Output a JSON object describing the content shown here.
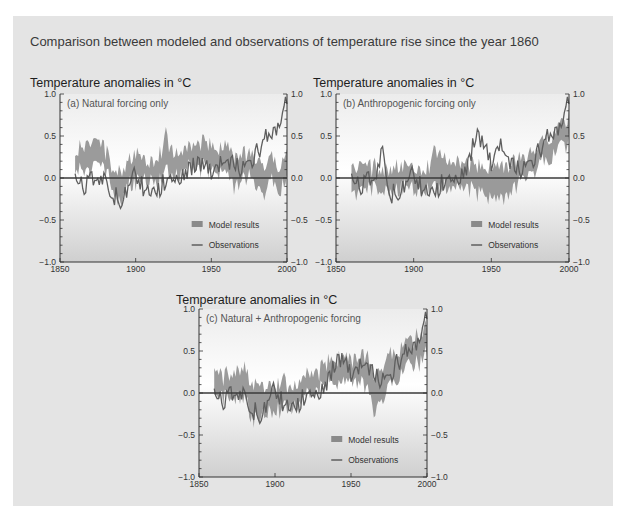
{
  "figure": {
    "title": "Comparison between modeled and observations of temperature rise since the year 1860",
    "colors": {
      "background": "#e4e4e4",
      "plot_top": "#ececec",
      "plot_mid": "#ffffff",
      "plot_bottom": "#cfcfcf",
      "model_band": "#8a8a8a",
      "observations": "#5e5e5e",
      "zero_line": "#3a3a3a"
    }
  },
  "chart_data": [
    {
      "id": "a",
      "type": "line",
      "title": "Temperature anomalies in °C",
      "panel_label": "(a) Natural forcing only",
      "xlabel": "",
      "ylabel": "Temperature anomalies in °C",
      "xlim": [
        1850,
        2000
      ],
      "ylim": [
        -1.0,
        1.0
      ],
      "x_ticks": [
        1850,
        1900,
        1950,
        2000
      ],
      "y_ticks": [
        -1.0,
        -0.5,
        0.0,
        0.5,
        1.0
      ],
      "y_tick_labels": [
        "−1.0",
        "−0.5",
        "0.0",
        "0.5",
        "1.0"
      ],
      "legend": [
        "Model results",
        "Observations"
      ],
      "legend_position": "lower right",
      "x": [
        1860,
        1865,
        1870,
        1875,
        1880,
        1885,
        1890,
        1895,
        1900,
        1905,
        1910,
        1915,
        1920,
        1925,
        1930,
        1935,
        1940,
        1945,
        1950,
        1955,
        1960,
        1965,
        1970,
        1975,
        1980,
        1985,
        1990,
        1995,
        2000
      ],
      "series": [
        {
          "name": "Model results (low)",
          "values": [
            0.15,
            0.15,
            0.12,
            0.15,
            0.1,
            -0.1,
            -0.25,
            -0.05,
            -0.05,
            0.0,
            0.05,
            0.0,
            0.1,
            0.05,
            0.1,
            0.15,
            0.12,
            0.15,
            0.12,
            0.1,
            0.1,
            -0.1,
            0.0,
            0.0,
            -0.05,
            -0.15,
            0.0,
            -0.1,
            0.0
          ]
        },
        {
          "name": "Model results (high)",
          "values": [
            0.3,
            0.35,
            0.4,
            0.4,
            0.3,
            0.1,
            0.05,
            0.2,
            0.25,
            0.2,
            0.2,
            0.25,
            0.45,
            0.3,
            0.3,
            0.35,
            0.35,
            0.4,
            0.35,
            0.35,
            0.35,
            0.2,
            0.25,
            0.25,
            0.2,
            0.15,
            0.2,
            0.15,
            0.25
          ]
        },
        {
          "name": "Observations",
          "values": [
            -0.05,
            -0.1,
            0.0,
            -0.05,
            -0.05,
            -0.2,
            -0.25,
            -0.15,
            0.05,
            -0.1,
            -0.2,
            -0.15,
            0.0,
            0.0,
            0.05,
            0.1,
            0.15,
            0.2,
            0.1,
            0.15,
            0.2,
            0.2,
            0.1,
            0.2,
            0.3,
            0.45,
            0.55,
            0.65,
            0.95
          ]
        }
      ]
    },
    {
      "id": "b",
      "type": "line",
      "title": "Temperature anomalies in °C",
      "panel_label": "(b) Anthropogenic forcing only",
      "xlabel": "",
      "ylabel": "Temperature anomalies in °C",
      "xlim": [
        1850,
        2000
      ],
      "ylim": [
        -1.0,
        1.0
      ],
      "x_ticks": [
        1850,
        1900,
        1950,
        2000
      ],
      "y_ticks": [
        -1.0,
        -0.5,
        0.0,
        0.5,
        1.0
      ],
      "y_tick_labels": [
        "−1.0",
        "−0.5",
        "0.0",
        "0.5",
        "1.0"
      ],
      "legend": [
        "Model results",
        "Observations"
      ],
      "legend_position": "lower right",
      "x": [
        1860,
        1865,
        1870,
        1875,
        1880,
        1885,
        1890,
        1895,
        1900,
        1905,
        1910,
        1915,
        1920,
        1925,
        1930,
        1935,
        1940,
        1945,
        1950,
        1955,
        1960,
        1965,
        1970,
        1975,
        1980,
        1985,
        1990,
        1995,
        2000
      ],
      "series": [
        {
          "name": "Model results (low)",
          "values": [
            -0.15,
            -0.15,
            -0.15,
            -0.1,
            -0.12,
            -0.1,
            -0.1,
            -0.1,
            -0.08,
            -0.1,
            -0.1,
            -0.1,
            -0.05,
            -0.1,
            -0.1,
            -0.1,
            -0.15,
            -0.15,
            -0.2,
            -0.25,
            -0.2,
            -0.1,
            0.0,
            0.1,
            0.15,
            0.25,
            0.3,
            0.4,
            0.45
          ]
        },
        {
          "name": "Model results (high)",
          "values": [
            0.1,
            0.1,
            0.1,
            0.1,
            0.1,
            0.1,
            0.1,
            0.1,
            0.12,
            0.1,
            0.15,
            0.3,
            0.25,
            0.15,
            0.15,
            0.15,
            0.1,
            0.12,
            0.1,
            0.1,
            0.1,
            0.15,
            0.2,
            0.3,
            0.35,
            0.45,
            0.5,
            0.6,
            0.7
          ]
        },
        {
          "name": "Observations",
          "values": [
            -0.05,
            -0.1,
            0.0,
            -0.05,
            0.3,
            -0.2,
            -0.15,
            -0.1,
            0.05,
            -0.1,
            -0.2,
            -0.15,
            0.0,
            0.0,
            0.05,
            0.15,
            0.5,
            0.45,
            0.2,
            0.4,
            0.25,
            0.15,
            0.1,
            0.2,
            0.3,
            0.45,
            0.55,
            0.65,
            0.95
          ]
        }
      ]
    },
    {
      "id": "c",
      "type": "line",
      "title": "Temperature anomalies in °C",
      "panel_label": "(c) Natural + Anthropogenic forcing",
      "xlabel": "",
      "ylabel": "Temperature anomalies in °C",
      "xlim": [
        1850,
        2000
      ],
      "ylim": [
        -1.0,
        1.0
      ],
      "x_ticks": [
        1850,
        1900,
        1950,
        2000
      ],
      "y_ticks": [
        -1.0,
        -0.5,
        0.0,
        0.5,
        1.0
      ],
      "y_tick_labels": [
        "−1.0",
        "−0.5",
        "0.0",
        "0.5",
        "1.0"
      ],
      "legend": [
        "Model results",
        "Observations"
      ],
      "legend_position": "lower right",
      "x": [
        1860,
        1865,
        1870,
        1875,
        1880,
        1885,
        1890,
        1895,
        1900,
        1905,
        1910,
        1915,
        1920,
        1925,
        1930,
        1935,
        1940,
        1945,
        1950,
        1955,
        1960,
        1965,
        1970,
        1975,
        1980,
        1985,
        1990,
        1995,
        2000
      ],
      "series": [
        {
          "name": "Model results (low)",
          "values": [
            -0.05,
            -0.05,
            0.0,
            0.0,
            0.0,
            -0.3,
            -0.3,
            -0.15,
            -0.15,
            -0.15,
            -0.15,
            -0.1,
            0.0,
            0.0,
            0.05,
            0.15,
            0.15,
            0.15,
            0.15,
            0.15,
            0.1,
            -0.2,
            -0.05,
            0.1,
            0.2,
            0.3,
            0.35,
            0.4,
            0.5
          ]
        },
        {
          "name": "Model results (high)",
          "values": [
            0.2,
            0.15,
            0.2,
            0.25,
            0.3,
            0.05,
            0.05,
            0.1,
            0.1,
            0.1,
            0.05,
            0.1,
            0.2,
            0.2,
            0.25,
            0.35,
            0.4,
            0.4,
            0.35,
            0.4,
            0.4,
            0.2,
            0.3,
            0.4,
            0.5,
            0.55,
            0.6,
            0.65,
            0.8
          ]
        },
        {
          "name": "Observations",
          "values": [
            -0.05,
            -0.1,
            0.0,
            -0.05,
            -0.05,
            -0.2,
            -0.25,
            -0.15,
            0.05,
            -0.1,
            -0.2,
            -0.15,
            0.0,
            0.0,
            0.05,
            0.15,
            0.35,
            0.45,
            0.25,
            0.3,
            0.35,
            0.25,
            0.15,
            0.2,
            0.35,
            0.45,
            0.55,
            0.65,
            0.95
          ]
        }
      ]
    }
  ]
}
